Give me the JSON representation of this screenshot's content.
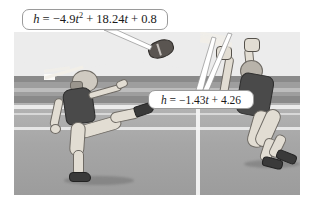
{
  "figure": {
    "type": "illustration",
    "style": "grayscale-textbook-art"
  },
  "callouts": [
    {
      "id": "projectile-equation",
      "text": "h = −4.9t² + 18.24t + 0.8",
      "parts": {
        "lhs": "h",
        "equals": "=",
        "term1_coef": "−4.9",
        "term1_var": "t",
        "term1_exp": "2",
        "plus1": "+",
        "term2_coef": "18.24",
        "term2_var": "t",
        "plus2": "+",
        "constant": "0.8"
      },
      "points_to": "football"
    },
    {
      "id": "defender-reach-equation",
      "text": "h = −1.43t + 4.26",
      "parts": {
        "lhs": "h",
        "equals": "=",
        "term1_coef": "−1.43",
        "term1_var": "t",
        "plus1": "+",
        "constant": "4.26"
      },
      "points_to": "receiver-hands"
    }
  ],
  "field": {
    "yard_marking_first": "5",
    "yard_marking_second": "0",
    "yard_marking": "50"
  },
  "players": [
    {
      "role": "kicker",
      "description": "player kicking the football"
    },
    {
      "role": "receiver",
      "description": "player leaping with arms raised"
    }
  ],
  "objects": [
    {
      "name": "football",
      "description": "football in flight above the field"
    }
  ],
  "colors": {
    "sky": "#ececec",
    "stands": "#9e9e9e",
    "field": "#a9a9a9",
    "yard_marking": "#bcbcbc",
    "line": "#f4f4f4",
    "jersey_dark": "#4a4a4a",
    "pants_light": "#e2ddd3",
    "callout_border": "#9a9a9a",
    "callout_fill": "#ffffff",
    "text": "#1a1a1a"
  }
}
